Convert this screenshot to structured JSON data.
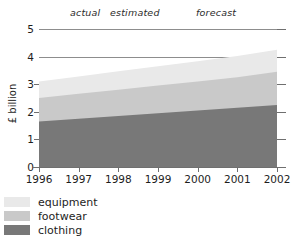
{
  "chart_data": {
    "type": "area",
    "title": "",
    "subtitle": "",
    "xlabel": "",
    "ylabel": "£ billion",
    "stacked": true,
    "grid": true,
    "legend_position": "bottom-left",
    "x": [
      1996,
      1997,
      1998,
      1999,
      2000,
      2001,
      2002
    ],
    "categories": [
      "1996",
      "1997",
      "1998",
      "1999",
      "2000",
      "2001",
      "2002"
    ],
    "xlim": [
      1996,
      2002
    ],
    "ylim": [
      0,
      5
    ],
    "yticks": [
      "0",
      "1",
      "2",
      "3",
      "4",
      "5"
    ],
    "ytick_values": [
      0,
      1,
      2,
      3,
      4,
      5
    ],
    "gridline_values": [
      4,
      5
    ],
    "series": [
      {
        "name": "clothing",
        "color": "#787878",
        "values": [
          1.65,
          1.75,
          1.85,
          1.95,
          2.05,
          2.15,
          2.25
        ]
      },
      {
        "name": "footwear",
        "color": "#c9c9c9",
        "values": [
          0.85,
          0.9,
          0.95,
          1.0,
          1.05,
          1.1,
          1.2
        ]
      },
      {
        "name": "equipment",
        "color": "#e9e9e9",
        "values": [
          0.6,
          0.63,
          0.67,
          0.7,
          0.73,
          0.77,
          0.8
        ]
      }
    ],
    "cumulative_tops": {
      "clothing": [
        1.65,
        1.75,
        1.85,
        1.95,
        2.05,
        2.15,
        2.25
      ],
      "footwear": [
        2.5,
        2.65,
        2.8,
        2.95,
        3.1,
        3.25,
        3.45
      ],
      "equipment": [
        3.1,
        3.28,
        3.47,
        3.65,
        3.83,
        4.02,
        4.25
      ]
    },
    "annotations": [
      {
        "text": "actual",
        "x": 1996.5
      },
      {
        "text": "estimated",
        "x": 1998.0
      },
      {
        "text": "forecast",
        "x": 2000.3
      }
    ]
  },
  "axis": {
    "ylabel": "£ billion",
    "yticks": [
      {
        "label": "5",
        "value": 5
      },
      {
        "label": "4",
        "value": 4
      },
      {
        "label": "3",
        "value": 3
      },
      {
        "label": "2",
        "value": 2
      },
      {
        "label": "1",
        "value": 1
      },
      {
        "label": "0",
        "value": 0
      }
    ],
    "xticks": [
      {
        "label": "1996"
      },
      {
        "label": "1997"
      },
      {
        "label": "1998"
      },
      {
        "label": "1999"
      },
      {
        "label": "2000"
      },
      {
        "label": "2001"
      },
      {
        "label": "2002"
      }
    ]
  },
  "annotations": {
    "actual": "actual",
    "estimated": "estimated",
    "forecast": "forecast"
  },
  "legend": {
    "items": [
      {
        "label": "equipment",
        "color": "#e9e9e9"
      },
      {
        "label": "footwear",
        "color": "#c9c9c9"
      },
      {
        "label": "clothing",
        "color": "#787878"
      }
    ]
  },
  "colors": {
    "equipment": "#e9e9e9",
    "footwear": "#c9c9c9",
    "clothing": "#787878",
    "axis": "#6f6f6f",
    "gridline": "#8d8d8d",
    "text": "#1d1d1d"
  }
}
